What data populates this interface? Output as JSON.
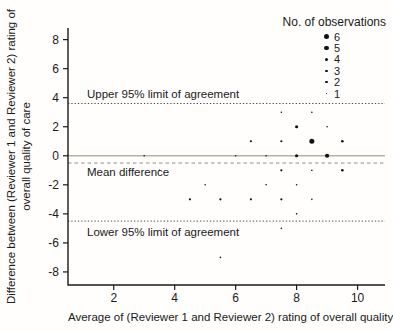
{
  "colors": {
    "point": "#111111",
    "axis": "#1a1a1a",
    "text": "#1a1a1a",
    "background": "#fffefd",
    "zero_line": "#b9b2a4",
    "mean_line": "#8f8f8f",
    "limit_line": "#4a4a4a"
  },
  "chart_data": {
    "type": "scatter",
    "title": "",
    "xlabel": "Average of (Reviewer 1 and Reviewer 2) rating of overall quality of care",
    "ylabel": "Difference between (Reviewer 1 and Reviewer 2) rating of overall quality of care",
    "ylabel_lines": [
      "Difference between (Reviewer 1 and Reviewer 2) rating of",
      "overall quality of care"
    ],
    "xlim": [
      0.5,
      10.9
    ],
    "ylim": [
      -8.9,
      8.8
    ],
    "xticks": [
      2,
      4,
      6,
      8,
      10
    ],
    "yticks": [
      -8,
      -6,
      -4,
      -2,
      0,
      2,
      4,
      6,
      8
    ],
    "grid": false,
    "legend_position": "top-right",
    "legend": {
      "title": "No. of observations",
      "sizes": [
        6,
        5,
        4,
        3,
        2,
        1
      ]
    },
    "reference_lines": {
      "zero": {
        "value": 0,
        "style": "solid",
        "label": ""
      },
      "mean": {
        "value": -0.5,
        "style": "dashed",
        "label": "Mean difference"
      },
      "upper": {
        "value": 3.6,
        "style": "dotted",
        "label": "Upper 95% limit of agreement"
      },
      "lower": {
        "value": -4.5,
        "style": "dotted",
        "label": "Lower 95% limit of agreement"
      }
    },
    "points": [
      {
        "x": 3,
        "y": 0,
        "n": 1
      },
      {
        "x": 3.5,
        "y": -1,
        "n": 1
      },
      {
        "x": 4.5,
        "y": -3,
        "n": 2
      },
      {
        "x": 5,
        "y": -2,
        "n": 1
      },
      {
        "x": 5.5,
        "y": -3,
        "n": 2
      },
      {
        "x": 5.5,
        "y": -7,
        "n": 1
      },
      {
        "x": 6,
        "y": 0,
        "n": 1
      },
      {
        "x": 6.5,
        "y": 1,
        "n": 2
      },
      {
        "x": 6.5,
        "y": -3,
        "n": 2
      },
      {
        "x": 7,
        "y": 0,
        "n": 1
      },
      {
        "x": 7,
        "y": -2,
        "n": 1
      },
      {
        "x": 7.5,
        "y": 3,
        "n": 1
      },
      {
        "x": 7.5,
        "y": 1,
        "n": 2
      },
      {
        "x": 7.5,
        "y": -1,
        "n": 2
      },
      {
        "x": 7.5,
        "y": -3,
        "n": 2
      },
      {
        "x": 7.5,
        "y": -5,
        "n": 1
      },
      {
        "x": 8,
        "y": 2,
        "n": 4
      },
      {
        "x": 8,
        "y": 0,
        "n": 4
      },
      {
        "x": 8,
        "y": -2,
        "n": 1
      },
      {
        "x": 8,
        "y": -4,
        "n": 1
      },
      {
        "x": 8.5,
        "y": 3,
        "n": 1
      },
      {
        "x": 8.5,
        "y": 1,
        "n": 6
      },
      {
        "x": 8.5,
        "y": -1,
        "n": 1
      },
      {
        "x": 8.5,
        "y": -3,
        "n": 1
      },
      {
        "x": 9,
        "y": 2,
        "n": 1
      },
      {
        "x": 9,
        "y": 0,
        "n": 5
      },
      {
        "x": 9.5,
        "y": 1,
        "n": 3
      },
      {
        "x": 9.5,
        "y": -1,
        "n": 3
      }
    ]
  }
}
